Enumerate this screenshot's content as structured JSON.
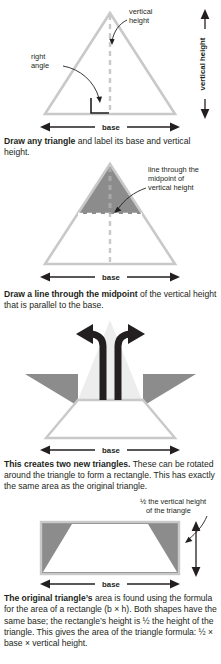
{
  "document": {
    "title": "Area of a triangle derivation",
    "colors": {
      "outline_gray": "#c9c9c9",
      "shade_gray": "#8c8c8c",
      "ghost_gray": "#ededed",
      "ink": "#231f20",
      "white": "#ffffff"
    }
  },
  "panels": [
    {
      "id": "panel-1",
      "labels": {
        "vertical_height_callout_line1": "vertical",
        "vertical_height_callout_line2": "height",
        "right_angle_line1": "right",
        "right_angle_line2": "angle",
        "base": "base",
        "vertical_height_axis": "vertical height"
      },
      "caption": {
        "bold": "Draw any triangle",
        "rest": " and label its base and vertical height."
      }
    },
    {
      "id": "panel-2",
      "labels": {
        "midline_callout_line1": "line through the",
        "midline_callout_line2": "midpoint of",
        "midline_callout_line3": "vertical height",
        "base": "base"
      },
      "caption": {
        "bold": "Draw a line through the midpoint",
        "rest": " of the vertical height that is parallel to the base."
      }
    },
    {
      "id": "panel-3",
      "labels": {
        "base": "base"
      },
      "caption": {
        "bold": "This creates two new triangles.",
        "rest": " These can be rotated around the triangle to form a rectangle. This has exactly the same area as the original triangle."
      }
    },
    {
      "id": "panel-4",
      "labels": {
        "half_height_line1": "½ the vertical height",
        "half_height_line2": "of the triangle",
        "base": "base"
      },
      "caption": {
        "bold": "The original triangle’s",
        "rest": " area is found using the formula for the area of a rectangle (b × h). Both shapes have the same base; the rectangle’s height is ½ the height of the triangle. This gives the area of the triangle formula: ½ × base × vertical height."
      }
    }
  ]
}
